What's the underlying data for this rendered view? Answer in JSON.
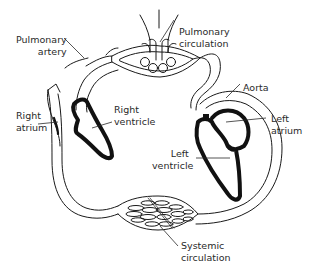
{
  "diagram": {
    "title": "",
    "colors": {
      "line": "#1a1a1a",
      "wall": "#111111",
      "text": "#2a2a2a",
      "background": "#ffffff"
    },
    "labels": {
      "pulmonary_artery": {
        "line1": "Pulmonary",
        "line2": "artery"
      },
      "pulmonary_circulation": {
        "line1": "Pulmonary",
        "line2": "circulation"
      },
      "aorta": {
        "line1": "Aorta"
      },
      "right_atrium": {
        "line1": "Right",
        "line2": "atrium"
      },
      "right_ventricle": {
        "line1": "Right",
        "line2": "ventricle"
      },
      "left_atrium": {
        "line1": "Left",
        "line2": "atrium"
      },
      "left_ventricle": {
        "line1": "Left",
        "line2": "ventricle"
      },
      "systemic_circulation": {
        "line1": "Systemic",
        "line2": "circulation"
      }
    }
  }
}
